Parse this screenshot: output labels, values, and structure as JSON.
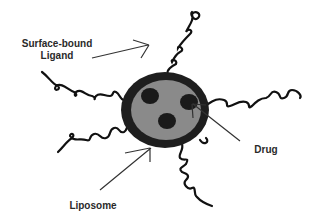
{
  "diagram": {
    "labels": {
      "ligand_line1": "Surface-bound",
      "ligand_line2": "Ligand",
      "drug": "Drug",
      "liposome": "Liposome"
    },
    "colors": {
      "membrane": "#1e1e1e",
      "core": "#8a8a8a",
      "drug": "#1a1a1a",
      "ligand": "#111111",
      "arrow": "#333333",
      "text": "#2a2a2a"
    },
    "drug_count": 3,
    "ligand_count": 6
  }
}
